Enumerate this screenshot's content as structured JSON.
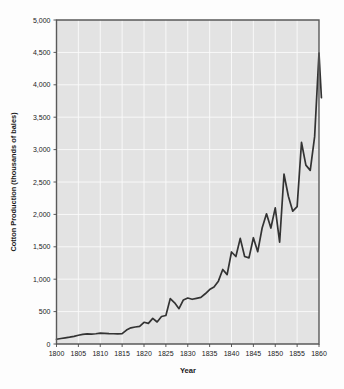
{
  "chart_data": {
    "type": "line",
    "title": "",
    "xlabel": "Year",
    "ylabel": "Cotton Production (thousands of bales)",
    "xlim": [
      1800,
      1860
    ],
    "ylim": [
      0,
      5000
    ],
    "grid": true,
    "legend": false,
    "xticks": [
      "1800",
      "1805",
      "1810",
      "1815",
      "1820",
      "1825",
      "1830",
      "1835",
      "1840",
      "1845",
      "1850",
      "1855",
      "1860"
    ],
    "yticks": [
      "0",
      "500",
      "1,000",
      "1,500",
      "2,000",
      "2,500",
      "3,000",
      "3,500",
      "4,000",
      "4,500",
      "5,000"
    ],
    "ytick_values": [
      0,
      500,
      1000,
      1500,
      2000,
      2500,
      3000,
      3500,
      4000,
      4500,
      5000
    ],
    "xtick_values": [
      1800,
      1805,
      1810,
      1815,
      1820,
      1825,
      1830,
      1835,
      1840,
      1845,
      1850,
      1855,
      1860
    ],
    "series": [
      {
        "name": "Cotton Production",
        "color": "#333333",
        "x": [
          1800,
          1801,
          1802,
          1803,
          1804,
          1805,
          1806,
          1807,
          1808,
          1809,
          1810,
          1811,
          1812,
          1813,
          1814,
          1815,
          1816,
          1817,
          1818,
          1819,
          1820,
          1821,
          1822,
          1823,
          1824,
          1825,
          1826,
          1827,
          1828,
          1829,
          1830,
          1831,
          1832,
          1833,
          1834,
          1835,
          1836,
          1837,
          1838,
          1839,
          1840,
          1841,
          1842,
          1843,
          1844,
          1845,
          1846,
          1847,
          1848,
          1849,
          1850,
          1851,
          1852,
          1853,
          1854,
          1855,
          1856,
          1857,
          1858,
          1859,
          1860
        ],
        "values": [
          73,
          85,
          95,
          105,
          118,
          135,
          148,
          155,
          152,
          158,
          168,
          165,
          160,
          158,
          155,
          160,
          215,
          250,
          262,
          272,
          335,
          318,
          395,
          340,
          425,
          440,
          700,
          635,
          545,
          680,
          710,
          690,
          705,
          720,
          775,
          840,
          880,
          970,
          1150,
          1070,
          1420,
          1350,
          1630,
          1350,
          1330,
          1640,
          1425,
          1790,
          2010,
          1790,
          2100,
          1570,
          2620,
          2280,
          2050,
          2120,
          3110,
          2760,
          2680,
          3200,
          4490
        ],
        "end_value_1861_partial": 3800
      },
      "note_overplot_tail_drop_to_3800_at_right_edge"
    ],
    "final_tail": {
      "x": 1860.55,
      "value": 3800
    }
  }
}
